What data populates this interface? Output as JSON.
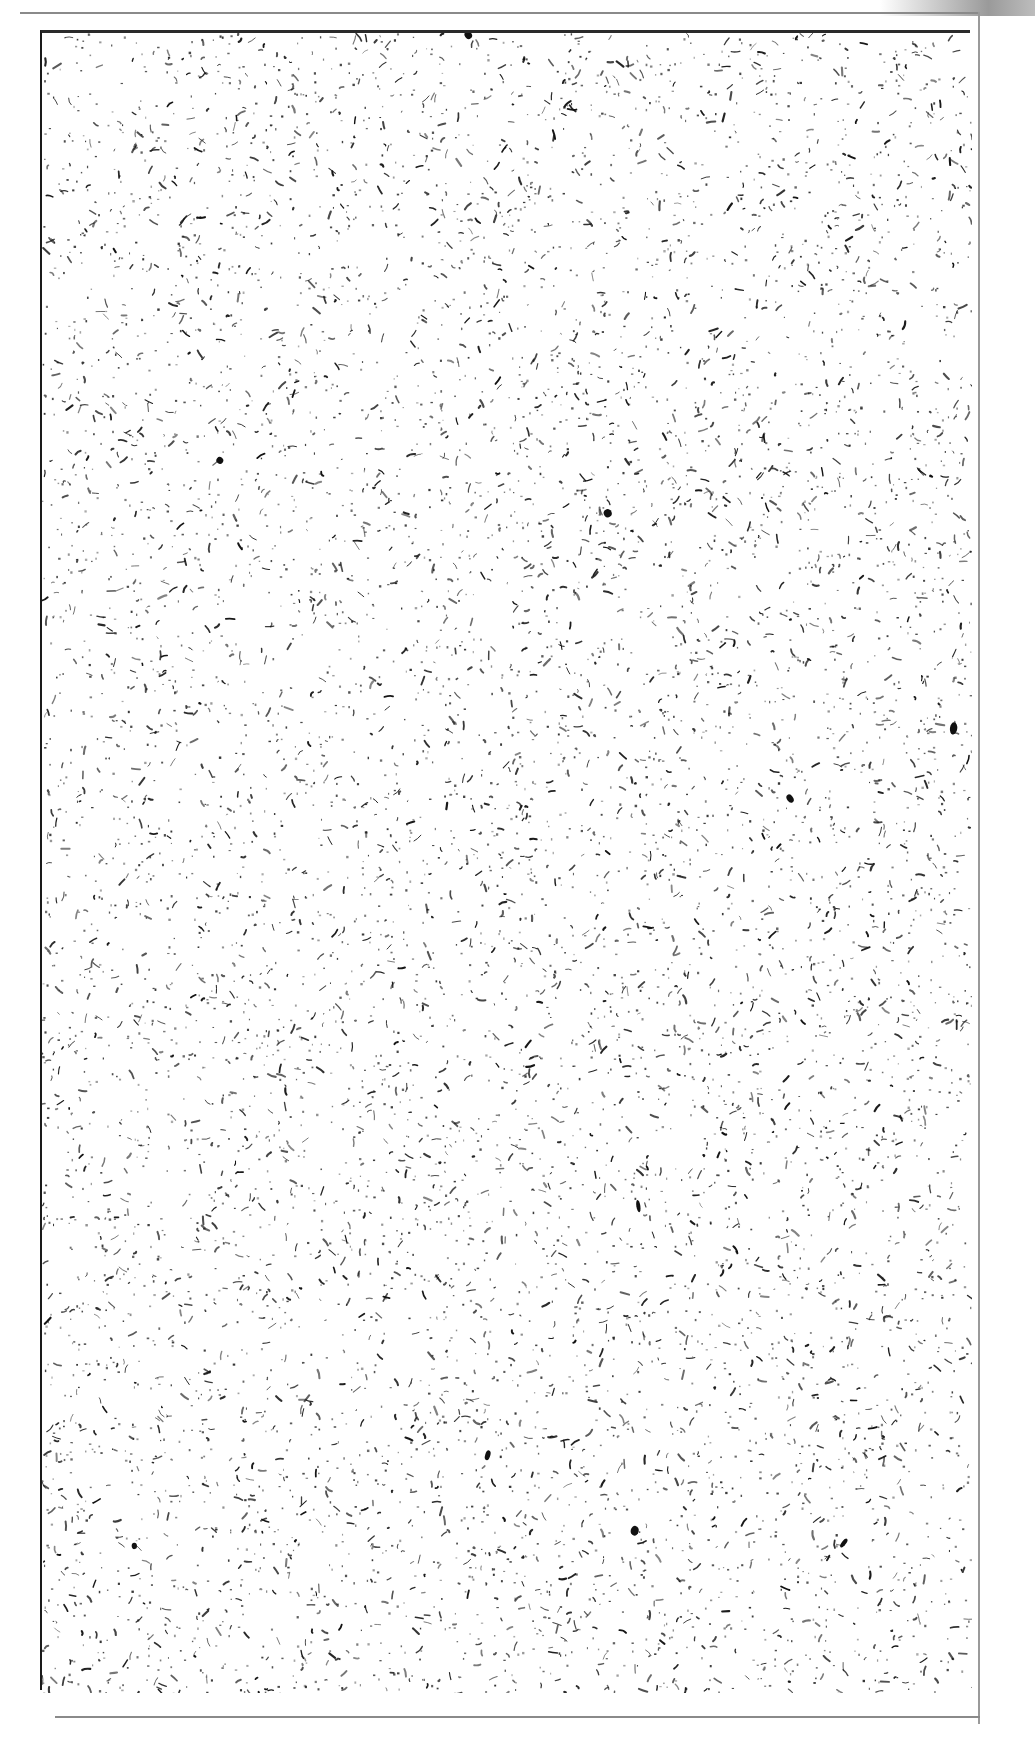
{
  "page": {
    "type": "scanned-speckle-page",
    "width": 1035,
    "height": 1762,
    "background_color": "#ffffff"
  },
  "frame": {
    "x": 40,
    "y": 30,
    "width": 930,
    "height": 1660,
    "border_color": "#1a1a1a"
  },
  "speckle": {
    "color": "#111111",
    "density": 9000,
    "seed": 1337,
    "min_length": 1,
    "max_length": 9,
    "blob_count": 10
  },
  "texts": []
}
